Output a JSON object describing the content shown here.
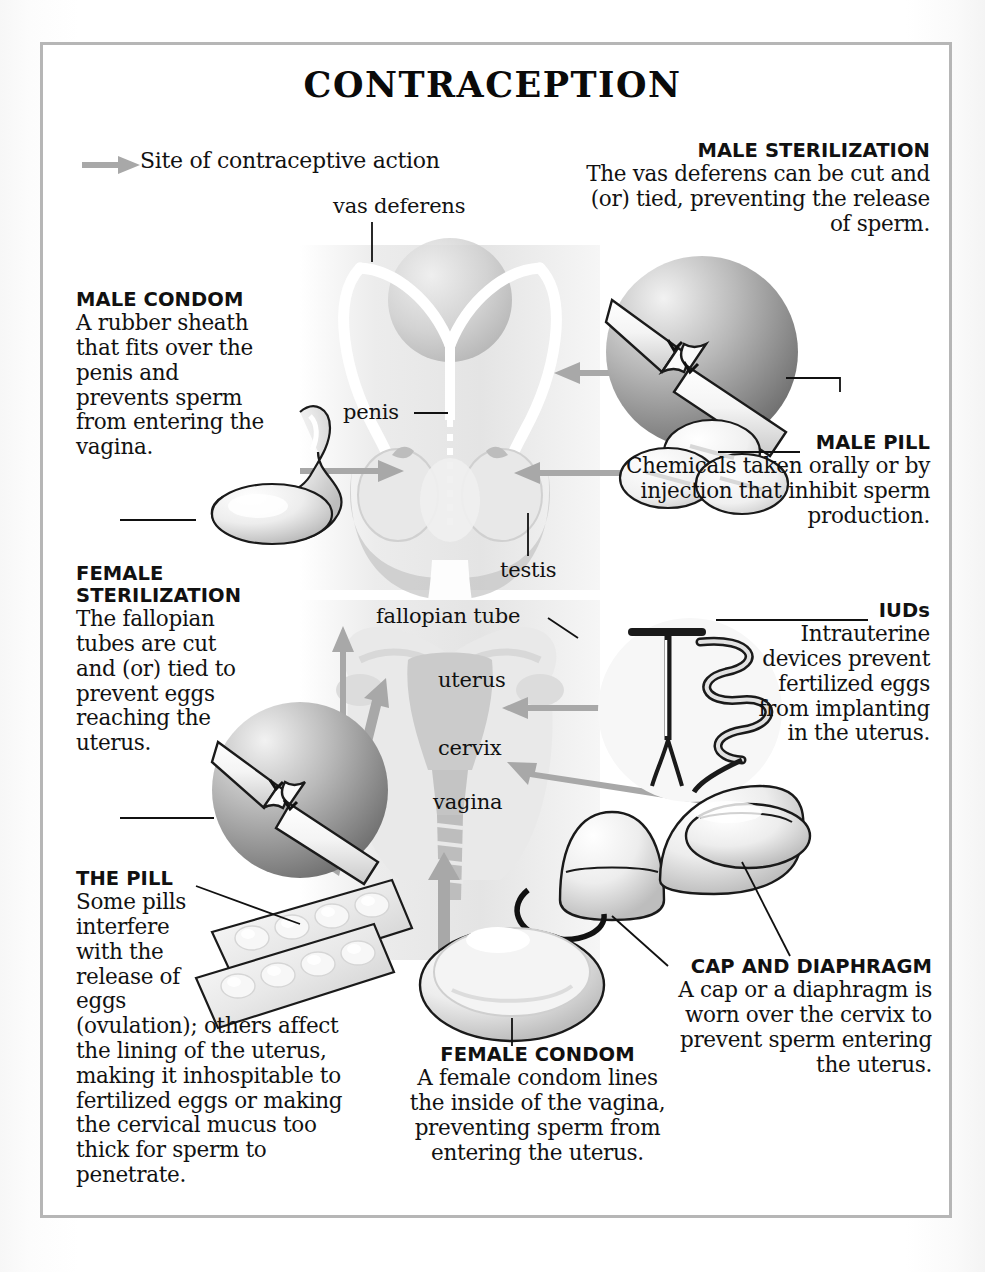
{
  "page": {
    "title": "CONTRACEPTION",
    "border_color": "#b6b6b6",
    "arrow_color": "#a0a0a0",
    "text_color": "#111111"
  },
  "legend": {
    "icon": "arrow-right-icon",
    "text": "Site of contraceptive action"
  },
  "anatomy_labels": {
    "vas_deferens": "vas deferens",
    "penis": "penis",
    "testis": "testis",
    "fallopian_tube": "fallopian tube",
    "uterus": "uterus",
    "cervix": "cervix",
    "vagina": "vagina"
  },
  "methods": [
    {
      "id": "male-sterilization",
      "heading": "MALE STERILIZATION",
      "body": "The vas deferens can be cut and (or) tied, preventing the release of sperm.",
      "align": "right"
    },
    {
      "id": "male-condom",
      "heading": "MALE CONDOM",
      "body": "A rubber sheath that fits over the penis and prevents sperm from entering the vagina.",
      "align": "left"
    },
    {
      "id": "male-pill",
      "heading": "MALE PILL",
      "body": "Chemicals taken orally or by injection that inhibit sperm production.",
      "align": "right"
    },
    {
      "id": "female-sterilization",
      "heading": "FEMALE STERILIZATION",
      "body": "The fallopian tubes are cut and (or) tied to prevent eggs reaching the uterus.",
      "align": "left"
    },
    {
      "id": "iuds",
      "heading": "IUDs",
      "body": "Intrauterine devices prevent fertilized eggs from implanting in the uterus.",
      "align": "right"
    },
    {
      "id": "the-pill",
      "heading": "THE PILL",
      "body_narrow": "Some pills interfere with the release of eggs",
      "body_wide": "(ovulation); others affect the lining of the uterus, making it inhospitable to fertilized eggs or making the cervical mucus too thick for sperm to penetrate.",
      "align": "left"
    },
    {
      "id": "female-condom",
      "heading": "FEMALE CONDOM",
      "body": "A female condom lines the inside of the vagina, preventing sperm from entering the uterus.",
      "align": "center"
    },
    {
      "id": "cap-and-diaphragm",
      "heading": "CAP AND DIAPHRAGM",
      "body": "A cap or a diaphragm is worn over the cervix to prevent sperm entering the uterus.",
      "align": "right"
    }
  ]
}
